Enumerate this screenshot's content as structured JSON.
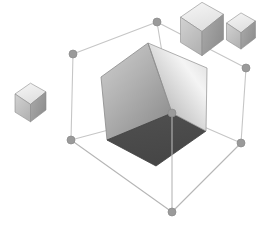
{
  "canvas": {
    "width": 268,
    "height": 238,
    "background_color": "#ffffff",
    "title": "3D cube selection viewport"
  },
  "palette": {
    "background": "#ffffff",
    "wire_line": "#b6b6b6",
    "wire_line_back": "#cfcfcf",
    "vertex_marker_fill": "#9a9a9a",
    "vertex_marker_stroke": "#8a8a8a",
    "cube_face_left_light": "#c9c9c9",
    "cube_face_left_dark": "#8f8f8f",
    "cube_face_right_light": "#f2f2f2",
    "cube_face_right_dark": "#9b9b9b",
    "cube_face_front_dark": "#4c4c4c",
    "cube_edge": "#7d7d7d",
    "small_cube_top": "#ededed",
    "small_cube_left": "#c4c4c4",
    "small_cube_right": "#9d9d9d",
    "small_cube_edge": "#8c8c8c"
  },
  "wireframe_box": {
    "name": "bounding-box",
    "vertices": [
      {
        "id": "v-top",
        "label": "top",
        "x": 157,
        "y": 22,
        "r": 4.0
      },
      {
        "id": "v-left-upper",
        "label": "left-upper",
        "x": 73,
        "y": 54,
        "r": 4.0
      },
      {
        "id": "v-right-upper",
        "label": "right-upper",
        "x": 246,
        "y": 68,
        "r": 4.0
      },
      {
        "id": "v-front-upper",
        "label": "front-upper",
        "x": 172,
        "y": 113,
        "r": 4.0
      },
      {
        "id": "v-left-lower",
        "label": "left-lower",
        "x": 71,
        "y": 140,
        "r": 4.0
      },
      {
        "id": "v-right-lower",
        "label": "right-lower",
        "x": 241,
        "y": 143,
        "r": 4.0
      },
      {
        "id": "v-bottom",
        "label": "bottom",
        "x": 172,
        "y": 212,
        "r": 4.0
      }
    ],
    "edges": [
      {
        "from": "v-top",
        "to": "v-left-upper"
      },
      {
        "from": "v-top",
        "to": "v-right-upper"
      },
      {
        "from": "v-top",
        "to": "v-front-upper"
      },
      {
        "from": "v-left-upper",
        "to": "v-left-lower"
      },
      {
        "from": "v-right-upper",
        "to": "v-right-lower"
      },
      {
        "from": "v-front-upper",
        "to": "v-bottom"
      },
      {
        "from": "v-left-lower",
        "to": "v-bottom"
      },
      {
        "from": "v-right-lower",
        "to": "v-bottom"
      },
      {
        "from": "v-left-lower",
        "to": "v-front-upper"
      },
      {
        "from": "v-right-lower",
        "to": "v-front-upper"
      }
    ],
    "line_width": 1.1
  },
  "main_cube": {
    "name": "main-cube",
    "label": "large shaded cube",
    "vertices": {
      "top": {
        "x": 148,
        "y": 43
      },
      "left": {
        "x": 101,
        "y": 77
      },
      "right": {
        "x": 207,
        "y": 68
      },
      "center_low": {
        "x": 172,
        "y": 113
      },
      "left_low": {
        "x": 107,
        "y": 140
      },
      "right_low": {
        "x": 206,
        "y": 131
      },
      "bottom": {
        "x": 156,
        "y": 166
      }
    },
    "faces": [
      {
        "id": "face-left",
        "label": "left face",
        "shade": "gradient-mid"
      },
      {
        "id": "face-right",
        "label": "right face",
        "shade": "gradient-light"
      },
      {
        "id": "face-front",
        "label": "front/lower face",
        "shade": "dark-flat"
      }
    ]
  },
  "small_cubes": [
    {
      "id": "small-cube-left",
      "label": "small cube left",
      "cx": 30.5,
      "cy": 102.5,
      "size": 15.5,
      "skew_y": 8.5
    },
    {
      "id": "small-cube-top-right-large",
      "label": "small cube upper right large",
      "cx": 202,
      "cy": 29,
      "size": 21.5,
      "skew_y": 11.5
    },
    {
      "id": "small-cube-top-right-small",
      "label": "small cube upper right small",
      "cx": 241,
      "cy": 31,
      "size": 14.5,
      "skew_y": 8.0
    }
  ]
}
